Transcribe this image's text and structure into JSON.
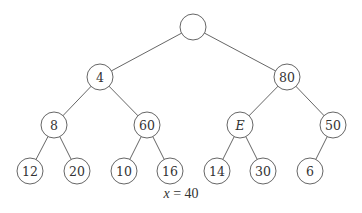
{
  "diagram": {
    "type": "binary-tree",
    "node_radius": 13,
    "colors": {
      "stroke": "#555555",
      "text": "#333333",
      "background": "#ffffff"
    },
    "nodes": [
      {
        "id": "root",
        "label": "",
        "x": 193,
        "y": 27,
        "italic": false
      },
      {
        "id": "n4",
        "label": "4",
        "x": 100,
        "y": 77,
        "italic": false
      },
      {
        "id": "n80",
        "label": "80",
        "x": 287,
        "y": 77,
        "italic": false
      },
      {
        "id": "n8",
        "label": "8",
        "x": 54,
        "y": 125,
        "italic": false
      },
      {
        "id": "n60",
        "label": "60",
        "x": 147,
        "y": 125,
        "italic": false
      },
      {
        "id": "nE",
        "label": "E",
        "x": 240,
        "y": 125,
        "italic": true
      },
      {
        "id": "n50",
        "label": "50",
        "x": 333,
        "y": 125,
        "italic": false
      },
      {
        "id": "n12",
        "label": "12",
        "x": 30,
        "y": 171,
        "italic": false
      },
      {
        "id": "n20",
        "label": "20",
        "x": 77,
        "y": 171,
        "italic": false
      },
      {
        "id": "n10",
        "label": "10",
        "x": 124,
        "y": 171,
        "italic": false
      },
      {
        "id": "n16",
        "label": "16",
        "x": 170,
        "y": 171,
        "italic": false
      },
      {
        "id": "n14",
        "label": "14",
        "x": 217,
        "y": 171,
        "italic": false
      },
      {
        "id": "n30",
        "label": "30",
        "x": 263,
        "y": 171,
        "italic": false
      },
      {
        "id": "n6",
        "label": "6",
        "x": 310,
        "y": 171,
        "italic": false
      }
    ],
    "edges": [
      [
        "root",
        "n4"
      ],
      [
        "root",
        "n80"
      ],
      [
        "n4",
        "n8"
      ],
      [
        "n4",
        "n60"
      ],
      [
        "n80",
        "nE"
      ],
      [
        "n80",
        "n50"
      ],
      [
        "n8",
        "n12"
      ],
      [
        "n8",
        "n20"
      ],
      [
        "n60",
        "n10"
      ],
      [
        "n60",
        "n16"
      ],
      [
        "nE",
        "n14"
      ],
      [
        "nE",
        "n30"
      ],
      [
        "n50",
        "n6"
      ]
    ]
  },
  "caption": {
    "variable": "x",
    "operator": " = ",
    "value": "40"
  }
}
